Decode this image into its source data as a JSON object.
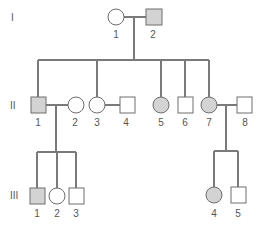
{
  "diagram": {
    "type": "pedigree",
    "colors": {
      "affected": "#d3d3d3",
      "unaffected": "#ffffff",
      "line": "#7a7a7a"
    },
    "generations": [
      {
        "label": "I"
      },
      {
        "label": "II"
      },
      {
        "label": "III"
      }
    ],
    "individuals": {
      "I": [
        {
          "id": "1",
          "sex": "female",
          "affected": false
        },
        {
          "id": "2",
          "sex": "male",
          "affected": true
        }
      ],
      "II": [
        {
          "id": "1",
          "sex": "male",
          "affected": true
        },
        {
          "id": "2",
          "sex": "female",
          "affected": false
        },
        {
          "id": "3",
          "sex": "female",
          "affected": false
        },
        {
          "id": "4",
          "sex": "male",
          "affected": false
        },
        {
          "id": "5",
          "sex": "female",
          "affected": true
        },
        {
          "id": "6",
          "sex": "male",
          "affected": false
        },
        {
          "id": "7",
          "sex": "female",
          "affected": true
        },
        {
          "id": "8",
          "sex": "male",
          "affected": false
        }
      ],
      "III": [
        {
          "id": "1",
          "sex": "male",
          "affected": true
        },
        {
          "id": "2",
          "sex": "female",
          "affected": false
        },
        {
          "id": "3",
          "sex": "male",
          "affected": false
        },
        {
          "id": "4",
          "sex": "female",
          "affected": true
        },
        {
          "id": "5",
          "sex": "male",
          "affected": false
        }
      ]
    },
    "matings": [
      {
        "partners": [
          "I-1",
          "I-2"
        ],
        "children": [
          "II-1",
          "II-3",
          "II-5",
          "II-6",
          "II-7"
        ]
      },
      {
        "partners": [
          "II-1",
          "II-2"
        ],
        "children": [
          "III-1",
          "III-2",
          "III-3"
        ]
      },
      {
        "partners": [
          "II-3",
          "II-4"
        ],
        "children": []
      },
      {
        "partners": [
          "II-7",
          "II-8"
        ],
        "children": [
          "III-4",
          "III-5"
        ]
      }
    ]
  }
}
